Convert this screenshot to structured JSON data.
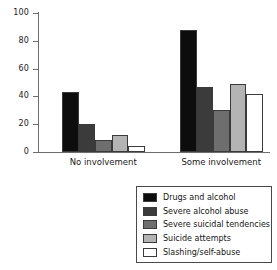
{
  "chart_data": {
    "type": "bar",
    "title": "",
    "xlabel": "",
    "ylabel": "",
    "ylim": [
      0,
      100
    ],
    "ytick_values": [
      0,
      20,
      40,
      60,
      80,
      100
    ],
    "ytick_labels": [
      "0",
      "20",
      "40",
      "60",
      "80",
      "100"
    ],
    "grid": false,
    "legend_position": "bottom-right",
    "categories": [
      "No involvement",
      "Some involvement"
    ],
    "series": [
      {
        "name": "Drugs and alcohol",
        "color": "#0d0d0d",
        "values": [
          43,
          88
        ]
      },
      {
        "name": "Severe alcohol abuse",
        "color": "#3b3b3b",
        "values": [
          20,
          47
        ]
      },
      {
        "name": "Severe suicidal tendencies",
        "color": "#6e6e6e",
        "values": [
          9,
          30
        ]
      },
      {
        "name": "Suicide attempts",
        "color": "#b4b4b4",
        "values": [
          12,
          49
        ]
      },
      {
        "name": "Slashing/self-abuse",
        "color": "#ffffff",
        "values": [
          4,
          42
        ]
      }
    ]
  }
}
